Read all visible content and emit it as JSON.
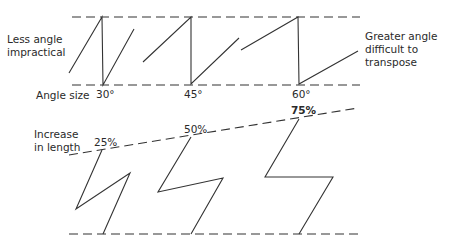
{
  "labels": {
    "less_angle": [
      "Less angle",
      "impractical"
    ],
    "greater_angle": [
      "Greater angle",
      "difficult to",
      "transpose"
    ],
    "angle_size": "Angle size",
    "increase_length": [
      "Increase",
      "in length"
    ]
  },
  "angles": [
    "30°",
    "45°",
    "60°"
  ],
  "increases": [
    "25%",
    "50%",
    "75%"
  ],
  "colors": {
    "line": "#333333",
    "background": "#ffffff"
  }
}
